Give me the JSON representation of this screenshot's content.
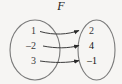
{
  "figure": {
    "name": "function-mapping-diagram",
    "function_label": "F",
    "background_color": "#f6f5f3",
    "stroke_color": "#6f6f6f",
    "text_color": "#3a3a3a"
  },
  "domain": {
    "name": "domain-set",
    "elements": [
      {
        "label": "1",
        "x": 33,
        "y": 31
      },
      {
        "label": "–2",
        "x": 33,
        "y": 46
      },
      {
        "label": "3",
        "x": 33,
        "y": 61
      }
    ]
  },
  "range": {
    "name": "range-set",
    "elements": [
      {
        "label": "2",
        "x": 90,
        "y": 31
      },
      {
        "label": "4",
        "x": 90,
        "y": 46
      },
      {
        "label": "–1",
        "x": 90,
        "y": 61
      }
    ]
  },
  "mappings": [
    {
      "name": "arrow-1-to-2",
      "from": "1",
      "to": "2"
    },
    {
      "name": "arrow-neg2-to-4",
      "from": "–2",
      "to": "4"
    },
    {
      "name": "arrow-3-to-neg1",
      "from": "3",
      "to": "–1"
    }
  ]
}
